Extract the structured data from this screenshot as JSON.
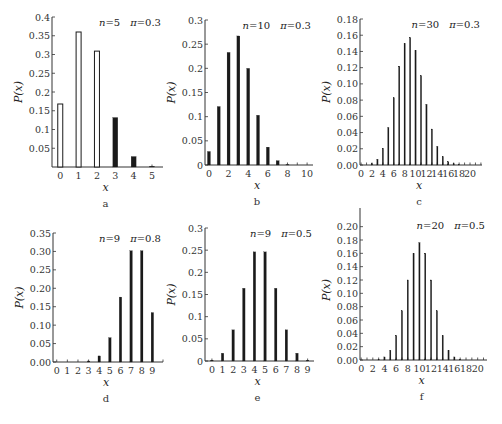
{
  "chart_data": [
    {
      "id": "a",
      "type": "bar",
      "panel_label": "a",
      "params": {
        "n_label": "n=5",
        "pi_label": "π=0.3"
      },
      "xlabel": "x",
      "ylabel": "P(x)",
      "categories": [
        0,
        1,
        2,
        3,
        4,
        5
      ],
      "values": [
        0.168,
        0.36,
        0.309,
        0.132,
        0.028,
        0.002
      ],
      "filled": [
        false,
        false,
        false,
        true,
        true,
        true
      ],
      "ylim": [
        0,
        0.4
      ],
      "yticks": [
        0.05,
        0.1,
        0.15,
        0.2,
        0.25,
        0.3,
        0.35,
        0.4
      ],
      "ytick_labels": [
        "0.05",
        "0.1",
        "0.15",
        "0.2",
        "0.25",
        "0.3",
        "0.35",
        "0.4"
      ],
      "xticks": [
        0,
        1,
        2,
        3,
        4,
        5
      ],
      "xlim": [
        -0.45,
        5.6
      ],
      "layout": {
        "x0": 52,
        "x1": 163,
        "ytop": 17,
        "ybase": 167,
        "bar_w": 5,
        "outline": true
      }
    },
    {
      "id": "b",
      "type": "bar",
      "panel_label": "b",
      "params": {
        "n_label": "n=10",
        "pi_label": "π=0.3"
      },
      "xlabel": "x",
      "ylabel": "P(x)",
      "categories": [
        0,
        1,
        2,
        3,
        4,
        5,
        6,
        7,
        8,
        9,
        10
      ],
      "values": [
        0.028,
        0.121,
        0.233,
        0.267,
        0.2,
        0.103,
        0.037,
        0.009,
        0.001,
        0.0001,
        0.0
      ],
      "ylim": [
        0,
        0.3
      ],
      "yticks": [
        0,
        0.05,
        0.1,
        0.15,
        0.2,
        0.25,
        0.3
      ],
      "ytick_labels": [
        "0",
        "0.05",
        "0.1",
        "0.15",
        "0.2",
        "0.25",
        "0.3"
      ],
      "xticks": [
        0,
        2,
        4,
        6,
        8,
        10
      ],
      "xlim": [
        -0.4,
        10.6
      ],
      "layout": {
        "x0": 205,
        "x1": 313,
        "ytop": 20,
        "ybase": 165,
        "bar_w": 3
      }
    },
    {
      "id": "c",
      "type": "bar",
      "panel_label": "c",
      "params": {
        "n_label": "n=30",
        "pi_label": "π=0.3"
      },
      "xlabel": "x",
      "ylabel": "P(x)",
      "categories": [
        0,
        1,
        2,
        3,
        4,
        5,
        6,
        7,
        8,
        9,
        10,
        11,
        12,
        13,
        14,
        15,
        16,
        17,
        18,
        19,
        20
      ],
      "values": [
        0.0,
        0.0003,
        0.0018,
        0.0072,
        0.0208,
        0.0464,
        0.0829,
        0.1219,
        0.1501,
        0.1573,
        0.1416,
        0.1103,
        0.0749,
        0.0444,
        0.0231,
        0.0106,
        0.0042,
        0.0015,
        0.0005,
        0.0001,
        0.0
      ],
      "ylim": [
        0,
        0.18
      ],
      "yticks": [
        0,
        0.02,
        0.04,
        0.06,
        0.08,
        0.1,
        0.12,
        0.14,
        0.16,
        0.18
      ],
      "ytick_labels": [
        "0.00",
        "0.02",
        "0.04",
        "0.06",
        "0.08",
        "0.10",
        "0.12",
        "0.14",
        "0.16",
        "0.18"
      ],
      "xticks": [
        0,
        2,
        4,
        6,
        8,
        10,
        12,
        14,
        16,
        18,
        20
      ],
      "xlim": [
        -0.2,
        22.2
      ],
      "layout": {
        "x0": 360,
        "x1": 482,
        "ytop": 19,
        "ybase": 165,
        "bar_w": 1.3
      }
    },
    {
      "id": "d",
      "type": "bar",
      "panel_label": "d",
      "params": {
        "n_label": "n=9",
        "pi_label": "π=0.8"
      },
      "xlabel": "x",
      "ylabel": "P(x)",
      "categories": [
        0,
        1,
        2,
        3,
        4,
        5,
        6,
        7,
        8,
        9
      ],
      "values": [
        1e-06,
        2e-05,
        0.0003,
        0.0028,
        0.0165,
        0.0661,
        0.1762,
        0.302,
        0.302,
        0.1342
      ],
      "ylim": [
        0,
        0.35
      ],
      "yticks": [
        0,
        0.05,
        0.1,
        0.15,
        0.2,
        0.25,
        0.3,
        0.35
      ],
      "ytick_labels": [
        "0.00",
        "0.05",
        "0.10",
        "0.15",
        "0.20",
        "0.25",
        "0.30",
        "0.35"
      ],
      "xticks": [
        0,
        1,
        2,
        3,
        4,
        5,
        6,
        7,
        8,
        9
      ],
      "xlim": [
        -0.35,
        10.0
      ],
      "layout": {
        "x0": 53,
        "x1": 163,
        "ytop": 233,
        "ybase": 362,
        "bar_w": 2.5
      }
    },
    {
      "id": "e",
      "type": "bar",
      "panel_label": "e",
      "params": {
        "n_label": "n=9",
        "pi_label": "π=0.5"
      },
      "xlabel": "x",
      "ylabel": "P(x)",
      "categories": [
        0,
        1,
        2,
        3,
        4,
        5,
        6,
        7,
        8,
        9
      ],
      "values": [
        0.002,
        0.0176,
        0.0703,
        0.1641,
        0.2461,
        0.2461,
        0.1641,
        0.0703,
        0.0176,
        0.002
      ],
      "ylim": [
        0,
        0.3
      ],
      "yticks": [
        0,
        0.05,
        0.1,
        0.15,
        0.2,
        0.25,
        0.3
      ],
      "ytick_labels": [
        "0",
        "0.05",
        "0.1",
        "0.15",
        "0.2",
        "0.25",
        "0.3"
      ],
      "xticks": [
        0,
        1,
        2,
        3,
        4,
        5,
        6,
        7,
        8,
        9
      ],
      "xlim": [
        -0.65,
        9.6
      ],
      "layout": {
        "x0": 205,
        "x1": 314,
        "ytop": 228,
        "ybase": 361,
        "bar_w": 2.5
      }
    },
    {
      "id": "f",
      "type": "bar",
      "panel_label": "f",
      "params": {
        "n_label": "n=20",
        "pi_label": "π=0.5"
      },
      "xlabel": "x",
      "ylabel": "P(x)",
      "categories": [
        0,
        1,
        2,
        3,
        4,
        5,
        6,
        7,
        8,
        9,
        10,
        11,
        12,
        13,
        14,
        15,
        16,
        17,
        18,
        19,
        20
      ],
      "values": [
        1e-06,
        2e-05,
        0.0002,
        0.0011,
        0.0046,
        0.0148,
        0.037,
        0.0739,
        0.1201,
        0.1602,
        0.1762,
        0.1602,
        0.1201,
        0.0739,
        0.037,
        0.0148,
        0.0046,
        0.0011,
        0.0002,
        2e-05,
        1e-06
      ],
      "ylim": [
        0,
        0.21
      ],
      "yticks": [
        0,
        0.02,
        0.04,
        0.06,
        0.08,
        0.1,
        0.12,
        0.14,
        0.16,
        0.18,
        0.2
      ],
      "ytick_labels": [
        "0.00",
        "0.02",
        "0.04",
        "0.06",
        "0.08",
        "0.10",
        "0.12",
        "0.14",
        "0.16",
        "0.18",
        "0.20"
      ],
      "xticks": [
        0,
        2,
        4,
        6,
        8,
        10,
        12,
        14,
        16,
        18,
        20
      ],
      "xlim": [
        -0.2,
        21.6
      ],
      "layout": {
        "x0": 360,
        "x1": 487,
        "ytop": 220,
        "ybase": 360,
        "bar_w": 1.3
      }
    }
  ]
}
